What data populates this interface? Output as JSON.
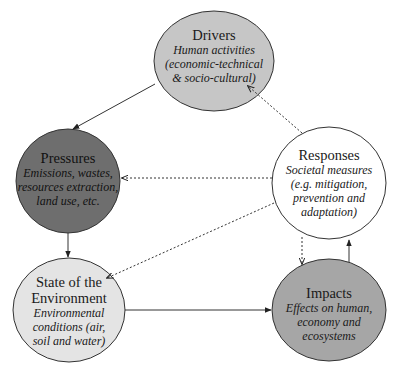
{
  "diagram": {
    "type": "DPSIR framework",
    "nodes": {
      "drivers": {
        "title": "Drivers",
        "description_lines": [
          "Human activities",
          "(economic-technical",
          "& socio-cultural)"
        ],
        "fill": "#c6c6c6"
      },
      "pressures": {
        "title": "Pressures",
        "description_lines": [
          "Emissions, wastes,",
          "resources extraction,",
          "land use, etc."
        ],
        "fill": "#6e6e6e"
      },
      "state": {
        "title_lines": [
          "State of the",
          "Environment"
        ],
        "description_lines": [
          "Environmental",
          "conditions (air,",
          "soil and water)"
        ],
        "fill": "#e4e4e4"
      },
      "impacts": {
        "title": "Impacts",
        "description_lines": [
          "Effects on human,",
          "economy and",
          "ecosystems"
        ],
        "fill": "#a6a6a6"
      },
      "responses": {
        "title": "Responses",
        "description_lines": [
          "Societal measures",
          "(e.g. mitigation,",
          "prevention and",
          "adaptation)"
        ],
        "fill": "#ffffff"
      }
    },
    "edges": [
      {
        "from": "Drivers",
        "to": "Pressures",
        "style": "solid"
      },
      {
        "from": "Pressures",
        "to": "State of the Environment",
        "style": "solid"
      },
      {
        "from": "State of the Environment",
        "to": "Impacts",
        "style": "solid"
      },
      {
        "from": "Impacts",
        "to": "Responses",
        "style": "solid"
      },
      {
        "from": "Responses",
        "to": "Drivers",
        "style": "dotted"
      },
      {
        "from": "Responses",
        "to": "Pressures",
        "style": "dotted"
      },
      {
        "from": "Responses",
        "to": "State of the Environment",
        "style": "dotted"
      },
      {
        "from": "Responses",
        "to": "Impacts",
        "style": "dotted"
      }
    ],
    "colors": {
      "outline": "#333333",
      "arrow": "#222222"
    }
  }
}
